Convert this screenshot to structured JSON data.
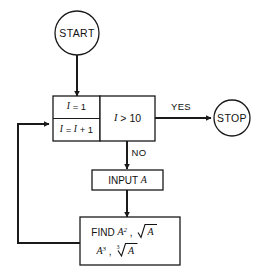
{
  "diagram": {
    "background_color": "#ffffff",
    "line_color": "#1a1a1a",
    "text_color": "#111111"
  },
  "nodes": {
    "start": {
      "type": "terminal",
      "label": "START",
      "shape": "circle",
      "cx": 77,
      "cy": 33,
      "r": 22
    },
    "stop": {
      "type": "terminal",
      "label": "STOP",
      "shape": "circle",
      "cx": 232,
      "cy": 118,
      "r": 18
    },
    "init": {
      "type": "process-cell",
      "label": "I = 1",
      "var": "I",
      "expr": "= 1"
    },
    "increment": {
      "type": "process-cell",
      "label": "I = I + 1",
      "var_left": "I",
      "eq": "=",
      "var_right": "I",
      "expr_tail": "+ 1"
    },
    "decision": {
      "type": "decision",
      "label": "I > 10",
      "var": "I",
      "operator": ">",
      "value": "10"
    },
    "input": {
      "type": "process",
      "label": "INPUT A",
      "keyword": "INPUT",
      "var": "A"
    },
    "find": {
      "type": "process",
      "label_line1": "FIND A2, √A",
      "label_line2": "A3, ∛A",
      "keyword": "FIND",
      "terms": [
        {
          "base": "A",
          "exponent": "2"
        },
        {
          "base": "A",
          "root_index": "",
          "radical": true
        },
        {
          "base": "A",
          "exponent": "3"
        },
        {
          "base": "A",
          "root_index": "3",
          "radical": true
        }
      ]
    }
  },
  "edges": {
    "start_to_loop": {
      "from": "start",
      "to": "init",
      "label": ""
    },
    "decision_yes": {
      "from": "decision",
      "to": "stop",
      "label": "YES"
    },
    "decision_no": {
      "from": "decision",
      "to": "input",
      "label": "NO"
    },
    "input_to_find": {
      "from": "input",
      "to": "find",
      "label": ""
    },
    "feedback": {
      "from": "find",
      "to": "increment",
      "label": ""
    }
  },
  "labels": {
    "yes": "YES",
    "no": "NO"
  }
}
